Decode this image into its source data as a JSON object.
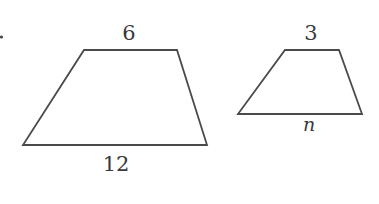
{
  "figure": {
    "marker_dot": {
      "x": 1,
      "y": 37
    },
    "colors": {
      "stroke": "#4a4a4a",
      "text": "#3a3a3a",
      "background": "#ffffff"
    },
    "large_trapezoid": {
      "points": "84,50 177,50 207,145 23,145",
      "top_label": "6",
      "bottom_label": "12"
    },
    "small_trapezoid": {
      "points": "285,50 339,50 362,114 238,114",
      "top_label": "3",
      "bottom_label": "n"
    }
  }
}
